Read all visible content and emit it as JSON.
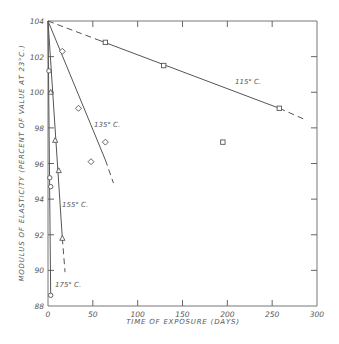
{
  "chart_data": {
    "type": "scatter",
    "title": "",
    "xlabel": "TIME OF EXPOSURE (DAYS)",
    "ylabel": "MODULUS OF ELASTICITY (PERCENT OF VALUE AT 23°C.)",
    "xlim": [
      0,
      300
    ],
    "ylim": [
      88,
      104
    ],
    "x_ticks": [
      0,
      50,
      100,
      150,
      200,
      250,
      300
    ],
    "x_tick_labels": [
      "0",
      "50",
      "100",
      "150",
      "200",
      "250",
      "300"
    ],
    "y_ticks": [
      88,
      90,
      92,
      94,
      96,
      98,
      100,
      102,
      104
    ],
    "y_tick_labels": [
      "88",
      "90",
      "92",
      "94",
      "96",
      "98",
      "100",
      "102",
      "104"
    ],
    "grid": false,
    "series": [
      {
        "name": "115° C.",
        "marker": "square",
        "points": [
          [
            64,
            102.8
          ],
          [
            129,
            101.5
          ],
          [
            195,
            97.2
          ],
          [
            258,
            99.1
          ]
        ],
        "fit": {
          "start": [
            0,
            104
          ],
          "solid_end": [
            258,
            99.1
          ],
          "dash_end": [
            285,
            98.5
          ],
          "lead_dash": true
        }
      },
      {
        "name": "135° C.",
        "marker": "diamond",
        "points": [
          [
            16,
            102.3
          ],
          [
            34,
            99.1
          ],
          [
            48,
            96.1
          ],
          [
            64,
            97.2
          ]
        ],
        "fit": {
          "start": [
            0,
            104
          ],
          "solid_end": [
            64,
            96.2
          ],
          "dash_end": [
            73,
            94.9
          ],
          "lead_dash": false
        }
      },
      {
        "name": "155° C.",
        "marker": "triangle",
        "points": [
          [
            3,
            100.0
          ],
          [
            8,
            97.3
          ],
          [
            12,
            95.6
          ],
          [
            16,
            91.8
          ]
        ],
        "fit": {
          "start": [
            0,
            104
          ],
          "solid_end": [
            16,
            91.8
          ],
          "dash_end": [
            19,
            89.9
          ],
          "lead_dash": false
        }
      },
      {
        "name": "175° C.",
        "marker": "circle",
        "points": [
          [
            1,
            101.2
          ],
          [
            2,
            95.2
          ],
          [
            3,
            94.7
          ],
          [
            3,
            88.6
          ]
        ],
        "fit": {
          "start": [
            0,
            104
          ],
          "solid_end": [
            3,
            88.6
          ],
          "dash_end": [
            3,
            88.6
          ],
          "lead_dash": false
        }
      }
    ],
    "legend": "none (inline series labels)",
    "annotations": [
      {
        "text": "115° C.",
        "near_series": "115° C."
      },
      {
        "text": "135° C.",
        "near_series": "135° C."
      },
      {
        "text": "155° C.",
        "near_series": "155° C."
      },
      {
        "text": "175° C.",
        "near_series": "175° C."
      }
    ]
  }
}
